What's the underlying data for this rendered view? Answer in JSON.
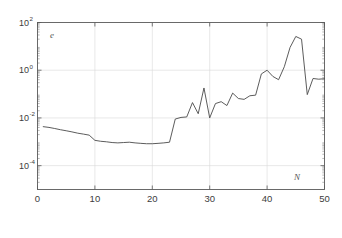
{
  "figure": {
    "background_color": "#ffffff",
    "axis_color": "#5a5a5a",
    "grid_color": "#d9d9d9",
    "line_color": "#4a4a4a"
  },
  "labels": {
    "y_axis_name": "e",
    "x_axis_name": "N",
    "y_tick_base": "10",
    "y_ticks": [
      {
        "base": "10",
        "exponent": "2"
      },
      {
        "base": "10",
        "exponent": "0"
      },
      {
        "base": "10",
        "exponent": "-2"
      },
      {
        "base": "10",
        "exponent": "-4"
      }
    ],
    "x_ticks": [
      "0",
      "10",
      "20",
      "30",
      "40",
      "50"
    ]
  },
  "chart_data": {
    "type": "line",
    "title": "",
    "xlabel": "N",
    "ylabel": "e",
    "yscale": "log",
    "xscale": "linear",
    "xlim": [
      0,
      50
    ],
    "ylim": [
      1e-05,
      100
    ],
    "grid": true,
    "legend": false,
    "x": [
      1,
      2,
      3,
      4,
      5,
      6,
      7,
      8,
      9,
      10,
      11,
      12,
      13,
      14,
      15,
      16,
      17,
      18,
      19,
      20,
      21,
      22,
      23,
      24,
      25,
      26,
      27,
      28,
      29,
      30,
      31,
      32,
      33,
      34,
      35,
      36,
      37,
      38,
      39,
      40,
      41,
      42,
      43,
      44,
      45,
      46,
      47,
      48,
      49,
      50
    ],
    "y": [
      0.0043,
      0.004,
      0.0036,
      0.0032,
      0.0029,
      0.0026,
      0.0023,
      0.0021,
      0.0019,
      0.00115,
      0.00105,
      0.001,
      0.00093,
      0.0009,
      0.00093,
      0.00096,
      0.0009,
      0.00086,
      0.00083,
      0.00083,
      0.00086,
      0.0009,
      0.00096,
      0.009,
      0.0105,
      0.011,
      0.044,
      0.015,
      0.18,
      0.01,
      0.04,
      0.048,
      0.033,
      0.11,
      0.065,
      0.06,
      0.085,
      0.09,
      0.7,
      1.0,
      0.55,
      0.4,
      1.4,
      9.0,
      26.0,
      20.0,
      0.095,
      0.45,
      0.42,
      0.44
    ],
    "series": [
      {
        "name": "error",
        "values": [
          0.0043,
          0.004,
          0.0036,
          0.0032,
          0.0029,
          0.0026,
          0.0023,
          0.0021,
          0.0019,
          0.00115,
          0.00105,
          0.001,
          0.00093,
          0.0009,
          0.00093,
          0.00096,
          0.0009,
          0.00086,
          0.00083,
          0.00083,
          0.00086,
          0.0009,
          0.00096,
          0.009,
          0.0105,
          0.011,
          0.044,
          0.015,
          0.18,
          0.01,
          0.04,
          0.048,
          0.033,
          0.11,
          0.065,
          0.06,
          0.085,
          0.09,
          0.7,
          1.0,
          0.55,
          0.4,
          1.4,
          9.0,
          26.0,
          20.0,
          0.095,
          0.45,
          0.42,
          0.44
        ]
      }
    ]
  }
}
